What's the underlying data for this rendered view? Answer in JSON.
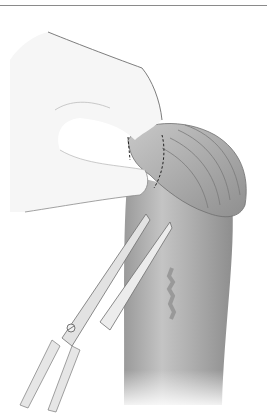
{
  "figure": {
    "type": "medical-illustration",
    "style": "grayscale line-and-tone drawing",
    "elements": [
      "top-rule",
      "hand",
      "tissue",
      "dashed-incision-line",
      "scissors"
    ],
    "colors": {
      "rule": "#8a8a8a",
      "skin_light": "#f4f4f4",
      "tissue_mid": "#a9a9a9",
      "tissue_dark": "#8c8c8c",
      "outline": "#6e6e6e",
      "dash": "#222222",
      "steel": "#dedede"
    }
  }
}
